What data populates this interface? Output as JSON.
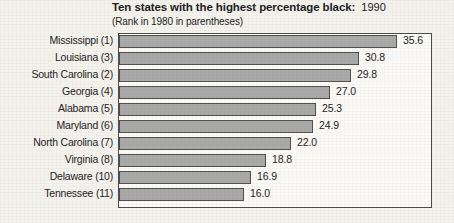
{
  "chart_data": {
    "type": "bar",
    "orientation": "horizontal",
    "title": "Ten states with the  highest percentage black:",
    "title_year": "1990",
    "subtitle": "(Rank in 1980 in parentheses)",
    "xlabel": "",
    "ylabel": "",
    "xlim": [
      0,
      40.2
    ],
    "grid": false,
    "legend": false,
    "bar_color": "#a9a9a9",
    "bar_border_color": "#4f4f4f",
    "frame_color": "#4a4a4a",
    "background_color": "#f4f2ed",
    "categories": [
      "Mississippi (1)",
      "Louisiana (3)",
      "South Carolina (2)",
      "Georgia (4)",
      "Alabama (5)",
      "Maryland (6)",
      "North Carolina (7)",
      "Virginia (8)",
      "Delaware (10)",
      "Tennessee (11)"
    ],
    "values": [
      35.6,
      30.8,
      29.8,
      27.0,
      25.3,
      24.9,
      22.0,
      18.8,
      16.9,
      16.0
    ],
    "value_labels": [
      "35.6",
      "30.8",
      "29.8",
      "27.0",
      "25.3",
      "24.9",
      "22.0",
      "18.8",
      "16.9",
      "16.0"
    ],
    "rows": [
      {
        "category": "Mississippi (1)",
        "value": 35.6,
        "value_label": "35.6"
      },
      {
        "category": "Louisiana (3)",
        "value": 30.8,
        "value_label": "30.8"
      },
      {
        "category": "South Carolina (2)",
        "value": 29.8,
        "value_label": "29.8"
      },
      {
        "category": "Georgia (4)",
        "value": 27.0,
        "value_label": "27.0"
      },
      {
        "category": "Alabama (5)",
        "value": 25.3,
        "value_label": "25.3"
      },
      {
        "category": "Maryland (6)",
        "value": 24.9,
        "value_label": "24.9"
      },
      {
        "category": "North Carolina (7)",
        "value": 22.0,
        "value_label": "22.0"
      },
      {
        "category": "Virginia (8)",
        "value": 18.8,
        "value_label": "18.8"
      },
      {
        "category": "Delaware (10)",
        "value": 16.9,
        "value_label": "16.9"
      },
      {
        "category": "Tennessee (11)",
        "value": 16.0,
        "value_label": "16.0"
      }
    ]
  }
}
